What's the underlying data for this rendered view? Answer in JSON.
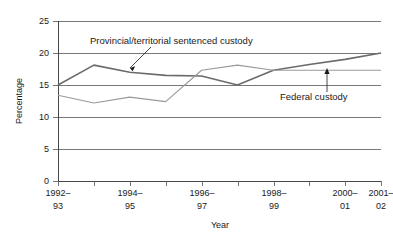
{
  "chart_data": {
    "type": "line",
    "title": "",
    "xlabel": "Year",
    "ylabel": "Percentage",
    "grid": "horizontal",
    "legend_position": "inline-annotations",
    "ylim": [
      0,
      25
    ],
    "yticks": [
      0,
      5,
      10,
      15,
      20,
      25
    ],
    "ytick_labels": [
      "0",
      "5",
      "10",
      "15",
      "20",
      "25"
    ],
    "x": [
      "1992-93",
      "1993-94",
      "1994-95",
      "1995-96",
      "1996-97",
      "1997-98",
      "1998-99",
      "1999-00",
      "2000-01",
      "2001-02"
    ],
    "xtick_labels": [
      "1992–93",
      "",
      "1994–95",
      "",
      "1996–97",
      "",
      "1998–99",
      "",
      "2000–01",
      "2001–02"
    ],
    "xtick_labels_visible": [
      "1992–93",
      "1994–95",
      "1996–97",
      "1998–99",
      "2000–01",
      "2001–02"
    ],
    "series": [
      {
        "name": "Provincial/territorial sentenced custody",
        "color": "#6b6b6b",
        "width": 1.6,
        "values": [
          15.0,
          18.1,
          17.0,
          16.5,
          16.4,
          15.0,
          17.3,
          18.2,
          19.0,
          20.0
        ]
      },
      {
        "name": "Federal custody",
        "color": "#9a9a9a",
        "width": 1.1,
        "values": [
          13.4,
          12.2,
          13.1,
          12.4,
          17.3,
          18.1,
          17.3,
          17.3,
          17.3,
          17.3
        ]
      }
    ],
    "annotations": [
      {
        "name": "provincial-territorial-annotation",
        "text": "Provincial/territorial sentenced custody",
        "points_to_series": "Provincial/territorial sentenced custody",
        "arrow": "down-left"
      },
      {
        "name": "federal-custody-annotation",
        "text": "Federal custody",
        "points_to_series": "Federal custody",
        "arrow": "up"
      }
    ]
  },
  "axes": {
    "y_title": "Percentage",
    "x_title": "Year",
    "y_tick_0": "0",
    "y_tick_1": "5",
    "y_tick_2": "10",
    "y_tick_3": "15",
    "y_tick_4": "20",
    "y_tick_5": "25",
    "x_tick_0_top": "1992–",
    "x_tick_0_bottom": "93",
    "x_tick_1_top": "1994–",
    "x_tick_1_bottom": "95",
    "x_tick_2_top": "1996–",
    "x_tick_2_bottom": "97",
    "x_tick_3_top": "1998–",
    "x_tick_3_bottom": "99",
    "x_tick_4_top": "2000–",
    "x_tick_4_bottom": "01",
    "x_tick_5_top": "2001–",
    "x_tick_5_bottom": "02"
  },
  "labels": {
    "provincial": "Provincial/territorial sentenced custody",
    "federal": "Federal custody"
  },
  "colors": {
    "provincial_line": "#6b6b6b",
    "federal_line": "#9a9a9a",
    "grid": "#555555",
    "text": "#1a1a1a",
    "background": "#ffffff"
  }
}
